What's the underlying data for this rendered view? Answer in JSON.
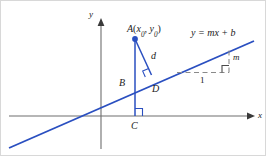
{
  "figure": {
    "background_color": "#ffffff",
    "line_color": "#2a4fc0",
    "axis_color": "#6e6e6e",
    "text_color": "#1a1a1a",
    "axes": {
      "x_label": "x",
      "y_label": "y"
    },
    "labels": {
      "point_a": "A",
      "point_a_coords_open": "(",
      "point_a_coords_x": "x",
      "point_a_coords_x_sub": "0",
      "point_a_coords_comma": ", ",
      "point_a_coords_y": "y",
      "point_a_coords_y_sub": "0",
      "point_a_coords_close": ")",
      "point_b": "B",
      "point_c": "C",
      "point_d": "D",
      "distance": "d",
      "line_equation_y": "y",
      "line_equation_rest": " = mx + b",
      "run": "1",
      "rise": "m"
    },
    "geometry": {
      "x_axis_y": 115,
      "y_axis_x": 100,
      "line_start": "8,147",
      "line_end": "253,40",
      "point_a": "134,38",
      "point_b": "134,82",
      "point_c": "134,115",
      "point_d": "150,73"
    }
  }
}
